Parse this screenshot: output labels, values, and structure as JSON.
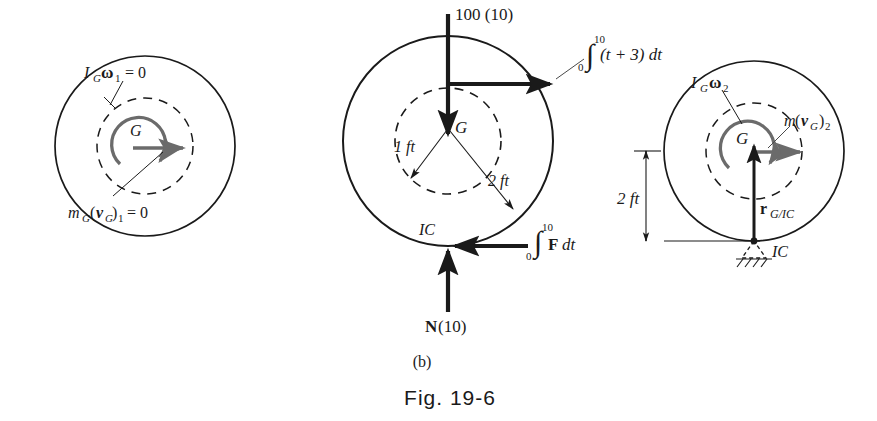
{
  "figure": {
    "caption_part": "(b)",
    "caption_main": "Fig. 19-6"
  },
  "panels": {
    "left": {
      "name": "initial-momentum-diagram",
      "center_label": "G",
      "angular_momentum": {
        "sym": "I",
        "sub": "G",
        "omega": "ω",
        "omega_sub": "1",
        "eq": "= 0"
      },
      "linear_momentum": {
        "sym": "m",
        "sub1": "G",
        "open": "(",
        "vec": "v",
        "vsub": "G",
        "close": ")",
        "sub2": "1",
        "eq": "= 0"
      }
    },
    "middle": {
      "name": "impulse-diagram",
      "center_label": "G",
      "weight_impulse": "100 (10)",
      "applied_impulse": {
        "integral": "∫",
        "lower": "0",
        "upper": "10",
        "expr": "(t + 3) dt"
      },
      "friction_impulse": {
        "integral": "∫",
        "lower": "0",
        "upper": "10",
        "vec": "F",
        "expr": "dt"
      },
      "normal_impulse": {
        "vec": "N",
        "expr": "(10)"
      },
      "contact_point": "IC",
      "dim_inner": "1 ft",
      "dim_outer": "2 ft"
    },
    "right": {
      "name": "final-momentum-diagram",
      "center_label": "G",
      "angular_momentum": {
        "sym": "I",
        "sub": "G",
        "omega": "ω",
        "omega_sub": "2"
      },
      "linear_momentum": {
        "sym": "m",
        "open": "(",
        "vec": "v",
        "vsub": "G",
        "close": ")",
        "sub": "2"
      },
      "position_vector": {
        "vec": "r",
        "sub": "G/IC"
      },
      "contact_point": "IC",
      "dimension": "2 ft"
    }
  },
  "colors": {
    "ink": "#1a1a1a",
    "momentum_gray": "#6b6b6b",
    "paper": "#ffffff"
  }
}
